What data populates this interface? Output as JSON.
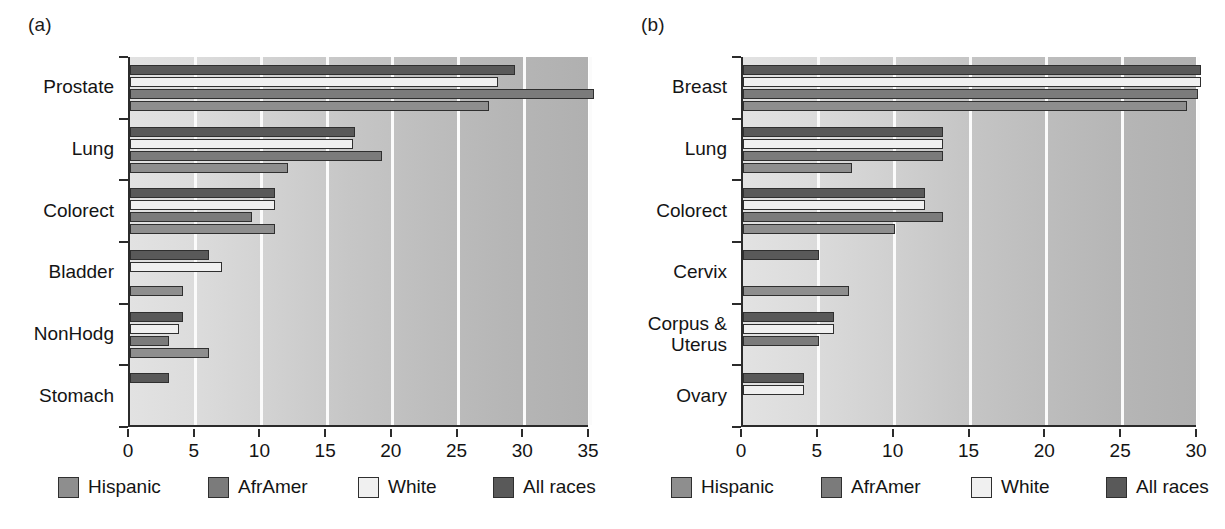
{
  "figure": {
    "panels": [
      {
        "tag": "(a)",
        "name": "panel-a-male"
      },
      {
        "tag": "(b)",
        "name": "panel-b-female"
      }
    ],
    "legend": {
      "entries": [
        {
          "label": "Hispanic",
          "color": "#8e8e8e"
        },
        {
          "label": "AfrAmer",
          "color": "#7b7b7b"
        },
        {
          "label": "White",
          "color": "#f0f0f0"
        },
        {
          "label": "All races",
          "color": "#595959"
        }
      ]
    }
  },
  "chart_data": [
    {
      "type": "bar",
      "orientation": "horizontal",
      "panel": "(a)",
      "title": "",
      "xlabel": "",
      "ylabel": "",
      "xlim": [
        0,
        35
      ],
      "xticks": [
        0,
        5,
        10,
        15,
        20,
        25,
        30,
        35
      ],
      "xtick_labels": [
        "0",
        "5",
        "10",
        "15",
        "20",
        "25",
        "30",
        "35"
      ],
      "grid": true,
      "legend_position": "below",
      "categories": [
        "Prostate",
        "Lung",
        "Colorect",
        "Bladder",
        "NonHodg",
        "Stomach"
      ],
      "series": [
        {
          "name": "All races",
          "color": "#595959",
          "values": [
            29.3,
            17.1,
            11.0,
            6.0,
            4.0,
            3.0
          ]
        },
        {
          "name": "White",
          "color": "#f0f0f0",
          "values": [
            28.0,
            17.0,
            11.0,
            7.0,
            3.7,
            0
          ]
        },
        {
          "name": "AfrAmer",
          "color": "#7b7b7b",
          "values": [
            35.3,
            19.2,
            9.3,
            0,
            3.0,
            0
          ]
        },
        {
          "name": "Hispanic",
          "color": "#8e8e8e",
          "values": [
            27.3,
            12.0,
            11.0,
            4.0,
            6.0,
            0
          ]
        }
      ]
    },
    {
      "type": "bar",
      "orientation": "horizontal",
      "panel": "(b)",
      "title": "",
      "xlabel": "",
      "ylabel": "",
      "xlim": [
        0,
        30
      ],
      "xticks": [
        0,
        5,
        10,
        15,
        20,
        25,
        30
      ],
      "xtick_labels": [
        "0",
        "5",
        "10",
        "15",
        "20",
        "25",
        "30"
      ],
      "grid": true,
      "legend_position": "below",
      "categories": [
        "Breast",
        "Lung",
        "Colorect",
        "Cervix",
        "Corpus &\nUterus",
        "Ovary"
      ],
      "series": [
        {
          "name": "All races",
          "color": "#595959",
          "values": [
            30.2,
            13.2,
            12.0,
            5.0,
            6.0,
            4.0
          ]
        },
        {
          "name": "White",
          "color": "#f0f0f0",
          "values": [
            30.2,
            13.2,
            12.0,
            0,
            6.0,
            4.0
          ]
        },
        {
          "name": "AfrAmer",
          "color": "#7b7b7b",
          "values": [
            30.0,
            13.2,
            13.2,
            0,
            5.0,
            0
          ]
        },
        {
          "name": "Hispanic",
          "color": "#8e8e8e",
          "values": [
            29.3,
            7.2,
            10.0,
            7.0,
            0,
            0
          ]
        }
      ]
    }
  ]
}
